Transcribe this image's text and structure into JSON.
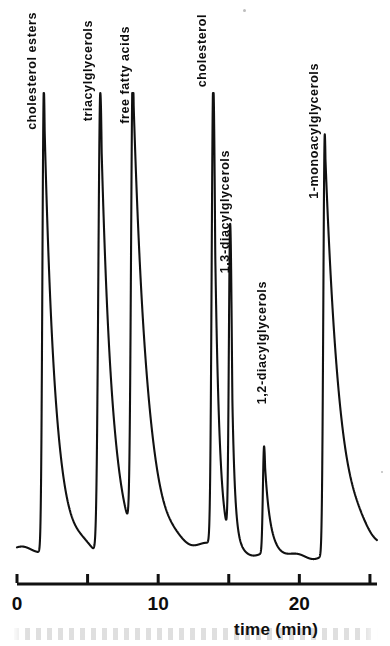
{
  "chart_data": {
    "type": "line",
    "title": "",
    "subtitle": "",
    "xlabel": "time (min)",
    "ylabel": "",
    "xlim": [
      0,
      25.5
    ],
    "ylim": [
      0,
      100
    ],
    "grid": false,
    "legend": "none",
    "x_ticks": [
      0,
      5,
      10,
      15,
      20,
      25
    ],
    "x_tick_labels": [
      "0",
      "",
      "10",
      "",
      "20",
      ""
    ],
    "series": [
      {
        "name": "detector response",
        "peaks": [
          {
            "label": "cholesterol esters",
            "retention_time": 1.9,
            "height": 100,
            "width": 0.22,
            "tail": 1.9
          },
          {
            "label": "triacylglycerols",
            "retention_time": 5.9,
            "height": 100,
            "width": 0.3,
            "tail": 2.0
          },
          {
            "label": "free fatty acids",
            "retention_time": 8.2,
            "height": 100,
            "width": 0.26,
            "tail": 2.5
          },
          {
            "label": "cholesterol",
            "retention_time": 13.9,
            "height": 100,
            "width": 0.24,
            "tail": 0.8
          },
          {
            "label": "1,3-diacylglycerols",
            "retention_time": 15.1,
            "height": 68,
            "width": 0.2,
            "tail": 0.5
          },
          {
            "label": "1,2-diacylglycerols",
            "retention_time": 17.5,
            "height": 23,
            "width": 0.18,
            "tail": 0.9
          },
          {
            "label": "1-monoacylglycerols",
            "retention_time": 21.8,
            "height": 91,
            "width": 0.22,
            "tail": 2.6
          }
        ]
      }
    ]
  },
  "axis": {
    "title": "time (min)",
    "tick_0": "0",
    "tick_10": "10",
    "tick_20": "20"
  },
  "labels": {
    "cholesterol_esters": "cholesterol esters",
    "triacylglycerols": "triacylglycerols",
    "free_fatty_acids": "free fatty acids",
    "cholesterol": "cholesterol",
    "diacylglycerols_13": "1,3-diacylglycerols",
    "diacylglycerols_12": "1,2-diacylglycerols",
    "monoacylglycerols_1": "1-monoacylglycerols"
  },
  "colors": {
    "trace": "#111111",
    "axis": "#111111",
    "background": "#ffffff"
  }
}
